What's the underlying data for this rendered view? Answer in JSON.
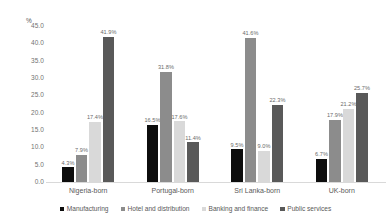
{
  "chart_data": {
    "type": "bar",
    "title": "",
    "subtitle": "",
    "xlabel": "",
    "ylabel": "%",
    "ylim": [
      0.0,
      45.0
    ],
    "ytick_step": 5.0,
    "ytick_labels": [
      "45.0",
      "40.0",
      "35.0",
      "30.0",
      "25.0",
      "20.0",
      "15.0",
      "10.0",
      "5.0",
      "0.0"
    ],
    "ytick_values": [
      45.0,
      40.0,
      35.0,
      30.0,
      25.0,
      20.0,
      15.0,
      10.0,
      5.0,
      0.0
    ],
    "grid": false,
    "legend_position": "bottom",
    "data_labels": true,
    "data_label_suffix": "%",
    "categories": [
      "Nigeria-born",
      "Portugal-born",
      "Sri Lanka-born",
      "UK-born"
    ],
    "series": [
      {
        "name": "Manufacturing",
        "color": "#0d0d0d",
        "values": [
          4.3,
          16.5,
          9.5,
          6.7
        ],
        "labels": [
          "4.3%",
          "16.5%",
          "9.5%",
          "6.7%"
        ]
      },
      {
        "name": "Hotel and distribution",
        "color": "#8c8c8c",
        "values": [
          7.9,
          31.8,
          41.6,
          17.9
        ],
        "labels": [
          "7.9%",
          "31.8%",
          "41.6%",
          "17.9%"
        ]
      },
      {
        "name": "Banking and finance",
        "color": "#d9d9d9",
        "values": [
          17.4,
          17.6,
          9.0,
          21.2
        ],
        "labels": [
          "17.4%",
          "17.6%",
          "9.0%",
          "21.2%"
        ]
      },
      {
        "name": "Public services",
        "color": "#595959",
        "values": [
          41.9,
          11.4,
          22.3,
          25.7
        ],
        "labels": [
          "41.9%",
          "11.4%",
          "22.3%",
          "25.7%"
        ]
      }
    ]
  },
  "colors": {
    "background": "#ffffff",
    "axis_line": "#d9d9d9",
    "tick_text": "#727272",
    "label_text": "#595959"
  }
}
